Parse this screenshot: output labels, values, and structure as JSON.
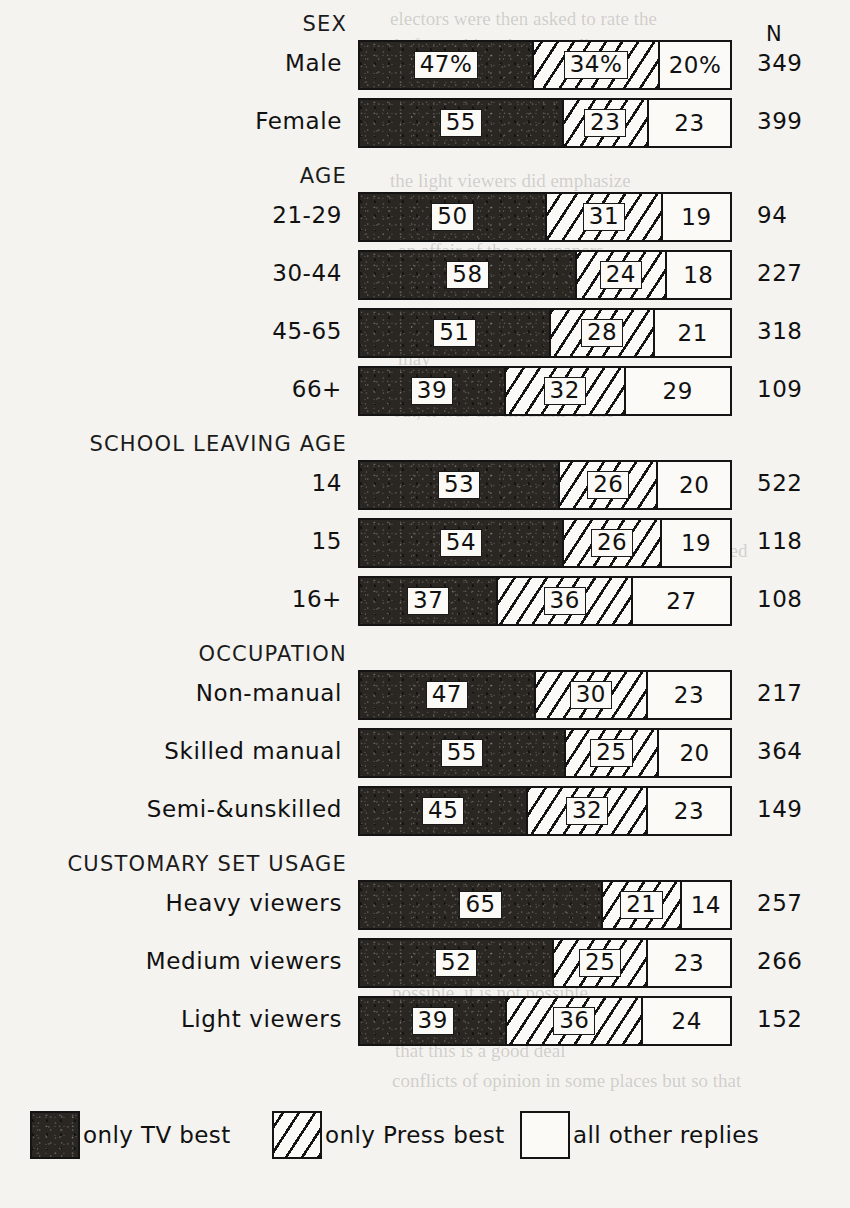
{
  "chart_data": {
    "type": "bar",
    "subtype": "100% stacked horizontal bar",
    "title": "",
    "xlabel": "",
    "ylabel": "",
    "xlim": [
      0,
      100
    ],
    "grid": false,
    "legend_position": "bottom",
    "n_column_header": "N",
    "series": [
      {
        "name": "only TV best",
        "key": "tv",
        "pattern": "solid-dark",
        "color": "#2a2622"
      },
      {
        "name": "only Press best",
        "key": "press",
        "pattern": "diagonal-hatch",
        "color": "#fbfaf7"
      },
      {
        "name": "all other replies",
        "key": "other",
        "pattern": "plain-white",
        "color": "#fbfaf7"
      }
    ],
    "groups": [
      {
        "header": "SEX",
        "rows": [
          {
            "label": "Male",
            "values": [
              47,
              34,
              20
            ],
            "labels": [
              "47%",
              "34%",
              "20%"
            ],
            "n": "349"
          },
          {
            "label": "Female",
            "values": [
              55,
              23,
              23
            ],
            "labels": [
              "55",
              "23",
              "23"
            ],
            "n": "399"
          }
        ]
      },
      {
        "header": "AGE",
        "rows": [
          {
            "label": "21-29",
            "values": [
              50,
              31,
              19
            ],
            "labels": [
              "50",
              "31",
              "19"
            ],
            "n": "94"
          },
          {
            "label": "30-44",
            "values": [
              58,
              24,
              18
            ],
            "labels": [
              "58",
              "24",
              "18"
            ],
            "n": "227"
          },
          {
            "label": "45-65",
            "values": [
              51,
              28,
              21
            ],
            "labels": [
              "51",
              "28",
              "21"
            ],
            "n": "318"
          },
          {
            "label": "66+",
            "values": [
              39,
              32,
              29
            ],
            "labels": [
              "39",
              "32",
              "29"
            ],
            "n": "109"
          }
        ]
      },
      {
        "header": "SCHOOL LEAVING AGE",
        "rows": [
          {
            "label": "14",
            "values": [
              53,
              26,
              20
            ],
            "labels": [
              "53",
              "26",
              "20"
            ],
            "n": "522"
          },
          {
            "label": "15",
            "values": [
              54,
              26,
              19
            ],
            "labels": [
              "54",
              "26",
              "19"
            ],
            "n": "118"
          },
          {
            "label": "16+",
            "values": [
              37,
              36,
              27
            ],
            "labels": [
              "37",
              "36",
              "27"
            ],
            "n": "108"
          }
        ]
      },
      {
        "header": "OCCUPATION",
        "rows": [
          {
            "label": "Non-manual",
            "values": [
              47,
              30,
              23
            ],
            "labels": [
              "47",
              "30",
              "23"
            ],
            "n": "217"
          },
          {
            "label": "Skilled manual",
            "values": [
              55,
              25,
              20
            ],
            "labels": [
              "55",
              "25",
              "20"
            ],
            "n": "364"
          },
          {
            "label": "Semi-&unskilled",
            "values": [
              45,
              32,
              23
            ],
            "labels": [
              "45",
              "32",
              "23"
            ],
            "n": "149"
          }
        ]
      },
      {
        "header": "CUSTOMARY SET USAGE",
        "rows": [
          {
            "label": "Heavy viewers",
            "values": [
              65,
              21,
              14
            ],
            "labels": [
              "65",
              "21",
              "14"
            ],
            "n": "257"
          },
          {
            "label": "Medium viewers",
            "values": [
              52,
              25,
              23
            ],
            "labels": [
              "52",
              "25",
              "23"
            ],
            "n": "266"
          },
          {
            "label": "Light  viewers",
            "values": [
              39,
              36,
              24
            ],
            "labels": [
              "39",
              "36",
              "24"
            ],
            "n": "152"
          }
        ]
      }
    ]
  },
  "legend": {
    "items": [
      {
        "label": "only TV best",
        "key": "tv",
        "x": 30
      },
      {
        "label": "only Press best",
        "key": "press",
        "x": 272
      },
      {
        "label": "all other replies",
        "key": "other",
        "x": 520
      }
    ]
  },
  "background_bleed": [
    {
      "text": "electors were then asked to rate the",
      "x": 390,
      "y": 8,
      "size": 19
    },
    {
      "text": "before  asking   the   more   direct",
      "x": 395,
      "y": 35,
      "size": 19
    },
    {
      "text": "way, by the   way,   on  balance,",
      "x": 400,
      "y": 64,
      "size": 19
    },
    {
      "text": "the light viewers  did  emphasize",
      "x": 390,
      "y": 170,
      "size": 19
    },
    {
      "text": "heavily   on  the   television   to",
      "x": 395,
      "y": 205,
      "size": 19
    },
    {
      "text": "an  affair  of   the   newspapers",
      "x": 398,
      "y": 240,
      "size": 19
    },
    {
      "text": "side.",
      "x": 398,
      "y": 312,
      "size": 19
    },
    {
      "text": "may",
      "x": 398,
      "y": 348,
      "size": 19
    },
    {
      "text": "out, it was the  medium  of  the",
      "x": 392,
      "y": 400,
      "size": 19
    },
    {
      "text": "linked",
      "x": 700,
      "y": 540,
      "size": 19
    },
    {
      "text": "The  reader may assume that any  expression",
      "x": 390,
      "y": 950,
      "size": 19
    },
    {
      "text": "possible, it  is  not  possible.",
      "x": 392,
      "y": 982,
      "size": 19
    },
    {
      "text": "that  this  is a  good  deal",
      "x": 395,
      "y": 1040,
      "size": 19
    },
    {
      "text": "conflicts of  opinion in some  places  but  so  that",
      "x": 392,
      "y": 1070,
      "size": 19
    }
  ]
}
